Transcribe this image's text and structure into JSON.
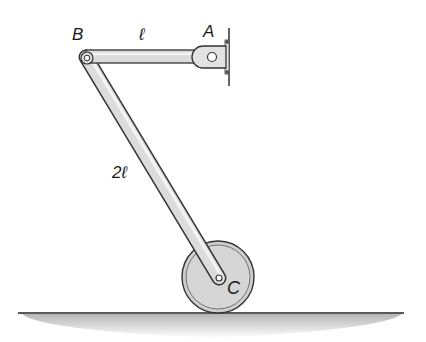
{
  "diagram": {
    "type": "mechanism",
    "labels": {
      "point_a": "A",
      "point_b": "B",
      "point_c": "C",
      "length_ab": "ℓ",
      "length_bc": "2ℓ"
    },
    "colors": {
      "link_fill": "#d9d9d9",
      "link_stroke": "#3a3a3a",
      "wheel_fill": "#cfcfcf",
      "ground_line": "#222222",
      "ground_shade": "#bdbdbd",
      "text": "#1a1a1a"
    }
  }
}
